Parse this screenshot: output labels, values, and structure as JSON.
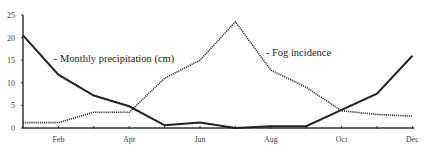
{
  "chart_data": {
    "type": "line",
    "title": "",
    "xlabel": "",
    "ylabel": "",
    "ylim": [
      0,
      25
    ],
    "yticks": [
      0,
      5,
      10,
      15,
      20,
      25
    ],
    "x": [
      "Jan",
      "Feb",
      "Mar",
      "Apr",
      "May",
      "Jun",
      "Jul",
      "Aug",
      "Sep",
      "Oct",
      "Nov",
      "Dec"
    ],
    "xtick_labels": [
      "Feb",
      "Apr",
      "Jun",
      "Aug",
      "Oct",
      "Dec"
    ],
    "grid": false,
    "series": [
      {
        "name": "Monthly precipitation (cm)",
        "style": "solid",
        "color": "#222222",
        "values": [
          20.5,
          11.8,
          7.2,
          4.8,
          0.6,
          1.2,
          0.0,
          0.4,
          0.4,
          4.0,
          7.6,
          16.0
        ]
      },
      {
        "name": "Fog incidence",
        "style": "dotted",
        "color": "#333333",
        "values": [
          1.2,
          1.2,
          3.5,
          3.5,
          11.0,
          15.0,
          23.5,
          12.8,
          9.0,
          3.8,
          3.0,
          2.6
        ]
      }
    ],
    "annotations": [
      {
        "text": "- Monthly precipitation (cm)",
        "x": "Mar",
        "y": 14.5
      },
      {
        "text": "- Fog incidence",
        "x": "Aug",
        "y": 16
      }
    ]
  }
}
